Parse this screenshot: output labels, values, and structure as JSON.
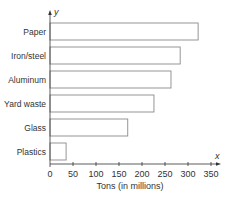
{
  "chart_data": {
    "type": "bar",
    "orientation": "horizontal",
    "title": "",
    "xlabel": "Tons (in millions)",
    "ylabel": "",
    "x_axis_variable": "x",
    "y_axis_variable": "y",
    "categories": [
      "Paper",
      "Iron/steel",
      "Aluminum",
      "Yard waste",
      "Glass",
      "Plastics"
    ],
    "values": [
      322,
      283,
      263,
      226,
      169,
      35
    ],
    "xlim": [
      0,
      350
    ],
    "xticks": [
      0,
      50,
      100,
      150,
      200,
      250,
      300,
      350
    ],
    "grid": false,
    "legend": null,
    "bar_fill": "#ffffff",
    "bar_stroke": "#8a8a8a"
  }
}
